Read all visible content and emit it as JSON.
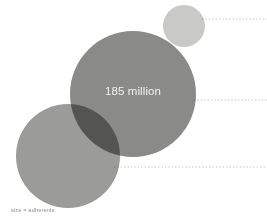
{
  "figure": {
    "width": 267,
    "height": 218,
    "background_color": "#ffffff",
    "caption": "size = adherents",
    "caption_color": "#8d8d8b"
  },
  "chart_data": {
    "type": "scatter",
    "title": "",
    "subtitle": "",
    "xlabel": "",
    "ylabel": "",
    "legend": [],
    "grid": false,
    "size_encoding": "size = adherents",
    "blend_mode": "multiply",
    "categories": [
      "small-bubble",
      "large-bubble",
      "left-bubble"
    ],
    "series": [
      {
        "name": "adherents",
        "values": [
          null,
          185000000,
          null
        ]
      }
    ],
    "bubbles": [
      {
        "name": "small-bubble",
        "cx": 184,
        "cy": 26,
        "r": 21,
        "color": "#c9c9c7",
        "opacity": 1,
        "label": ""
      },
      {
        "name": "large-bubble",
        "cx": 133,
        "cy": 94,
        "r": 63,
        "color": "#8a8a88",
        "opacity": 1,
        "label": "185 million",
        "label_color": "#f2f2f0"
      },
      {
        "name": "left-bubble",
        "cx": 68,
        "cy": 156,
        "r": 52,
        "color": "#9b9b99",
        "opacity": 1,
        "label": ""
      }
    ],
    "leader_lines": [
      {
        "name": "leader-line-top",
        "x1": 202,
        "x2": 267,
        "y": 19,
        "color": "#b9b9b7"
      },
      {
        "name": "leader-line-middle",
        "x1": 194,
        "x2": 267,
        "y": 100,
        "color": "#b9b9b7"
      },
      {
        "name": "leader-line-bottom",
        "x1": 114,
        "x2": 267,
        "y": 167,
        "color": "#b9b9b7"
      }
    ]
  }
}
